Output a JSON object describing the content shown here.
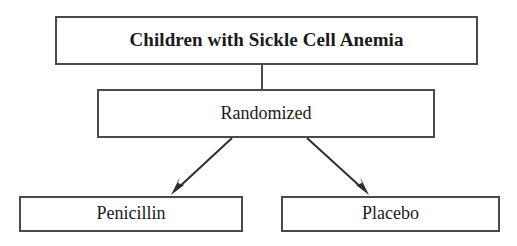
{
  "diagram": {
    "type": "flowchart",
    "background_color": "#ffffff",
    "border_color": "#4a4a4a",
    "text_color": "#1a1a1a",
    "nodes": [
      {
        "id": "root",
        "label": "Children with Sickle Cell Anemia",
        "role": "population",
        "emphasis": "bold"
      },
      {
        "id": "randomized",
        "label": "Randomized",
        "role": "allocation",
        "emphasis": "normal"
      },
      {
        "id": "penicillin",
        "label": "Penicillin",
        "role": "treatment-arm",
        "emphasis": "normal"
      },
      {
        "id": "placebo",
        "label": "Placebo",
        "role": "control-arm",
        "emphasis": "normal"
      }
    ],
    "edges": [
      {
        "id": "root-to-randomized",
        "from": "root",
        "to": "randomized",
        "style": "plain-line",
        "arrowhead": false
      },
      {
        "id": "randomized-to-penicillin",
        "from": "randomized",
        "to": "penicillin",
        "style": "diagonal-line",
        "arrowhead": true
      },
      {
        "id": "randomized-to-placebo",
        "from": "randomized",
        "to": "placebo",
        "style": "diagonal-line",
        "arrowhead": true
      }
    ]
  }
}
